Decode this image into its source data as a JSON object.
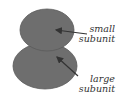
{
  "diagram": {
    "colors": {
      "subunit_fill": "#6e6e6e",
      "outline": "#5a5a5a",
      "arrow": "#333333",
      "label": "#333333",
      "background": "#ffffff"
    },
    "labels": {
      "small_line1": "small",
      "small_line2": "subunit",
      "large_line1": "large",
      "large_line2": "subunit"
    }
  }
}
